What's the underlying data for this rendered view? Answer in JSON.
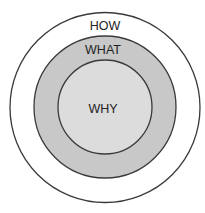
{
  "diagram": {
    "type": "concentric-circles",
    "title": "",
    "rings": [
      {
        "label": "HOW",
        "level": "outer",
        "fill": "#ffffff"
      },
      {
        "label": "WHAT",
        "level": "middle",
        "fill": "#c8c8c8"
      },
      {
        "label": "WHY",
        "level": "inner",
        "fill": "#dcdcdc"
      }
    ],
    "stroke_color": "#3a3a3a"
  }
}
